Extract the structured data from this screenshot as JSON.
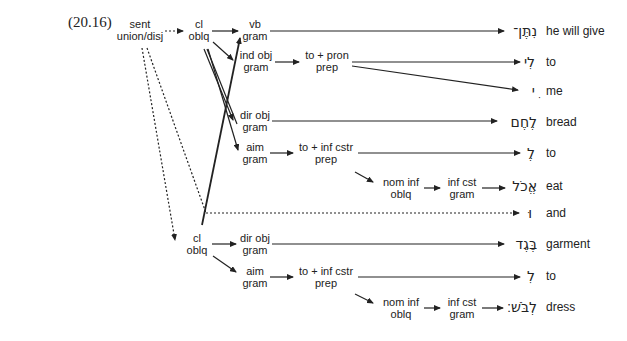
{
  "example_number": "(20.16)",
  "nodes": {
    "sent": {
      "l1": "sent",
      "l2": "union/disj"
    },
    "cl1": {
      "l1": "cl",
      "l2": "oblq"
    },
    "vb": {
      "l1": "vb",
      "l2": "gram"
    },
    "indobj": {
      "l1": "ind obj",
      "l2": "gram"
    },
    "topron": {
      "l1": "to + pron",
      "l2": "prep"
    },
    "dirobj1": {
      "l1": "dir obj",
      "l2": "gram"
    },
    "aim1": {
      "l1": "aim",
      "l2": "gram"
    },
    "toinf1": {
      "l1": "to + inf cstr",
      "l2": "prep"
    },
    "nominf1": {
      "l1": "nom inf",
      "l2": "oblq"
    },
    "infcst1": {
      "l1": "inf cst",
      "l2": "gram"
    },
    "cl2": {
      "l1": "cl",
      "l2": "oblq"
    },
    "dirobj2": {
      "l1": "dir obj",
      "l2": "gram"
    },
    "aim2": {
      "l1": "aim",
      "l2": "gram"
    },
    "toinf2": {
      "l1": "to + inf cstr",
      "l2": "prep"
    },
    "nominf2": {
      "l1": "nom inf",
      "l2": "oblq"
    },
    "infcst2": {
      "l1": "inf cst",
      "l2": "gram"
    }
  },
  "words": [
    {
      "hebrew": "נִתֶּן־",
      "gloss": "he will give"
    },
    {
      "hebrew": "לִי",
      "gloss": "to"
    },
    {
      "hebrew": "ִי",
      "gloss": "me"
    },
    {
      "hebrew": "לֶחֶם",
      "gloss": "bread"
    },
    {
      "hebrew": "לֶ",
      "gloss": "to"
    },
    {
      "hebrew": "אֱכֹל",
      "gloss": "eat"
    },
    {
      "hebrew": "וּ",
      "gloss": "and"
    },
    {
      "hebrew": "בֶּגֶד",
      "gloss": "garment"
    },
    {
      "hebrew": "לִ",
      "gloss": "to"
    },
    {
      "hebrew": "לְבֹּשׁ׃",
      "gloss": "dress"
    }
  ],
  "colors": {
    "ink": "#222222",
    "background": "#ffffff"
  }
}
